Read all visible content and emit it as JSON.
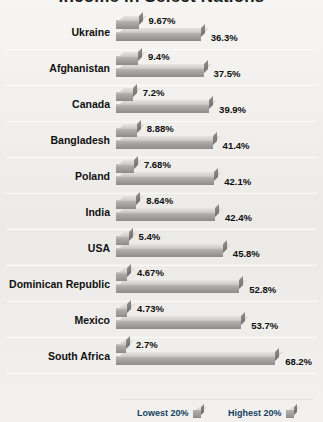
{
  "title": "Income in Select Nations",
  "legend": {
    "lowest_label": "Lowest 20%",
    "highest_label": "Highest 20%",
    "lowest_icon": "cube-swatch-icon",
    "highest_icon": "cube-swatch-icon",
    "text_color": "#14425f"
  },
  "chart_data": {
    "type": "bar",
    "title": "Income in Select Nations",
    "orientation": "horizontal",
    "grouped": true,
    "xlabel": "",
    "ylabel": "",
    "xlim": [
      0,
      72
    ],
    "grid": false,
    "legend_position": "bottom",
    "value_suffix": "%",
    "categories": [
      "Ukraine",
      "Afghanistan",
      "Canada",
      "Bangladesh",
      "Poland",
      "India",
      "USA",
      "Dominican Republic",
      "Mexico",
      "South Africa"
    ],
    "series": [
      {
        "name": "Lowest 20%",
        "values": [
          9.67,
          9.4,
          7.2,
          8.88,
          7.68,
          8.64,
          5.4,
          4.67,
          4.73,
          2.7
        ],
        "labels": [
          "9.67%",
          "9.4%",
          "7.2%",
          "8.88%",
          "7.68%",
          "8.64%",
          "5.4%",
          "4.67%",
          "4.73%",
          "2.7%"
        ]
      },
      {
        "name": "Highest 20%",
        "values": [
          36.3,
          37.5,
          39.9,
          41.4,
          42.1,
          42.4,
          45.8,
          52.8,
          53.7,
          68.2
        ],
        "labels": [
          "36.3%",
          "37.5%",
          "39.9%",
          "41.4%",
          "42.1%",
          "42.4%",
          "45.8%",
          "52.8%",
          "53.7%",
          "68.2%"
        ]
      }
    ]
  }
}
